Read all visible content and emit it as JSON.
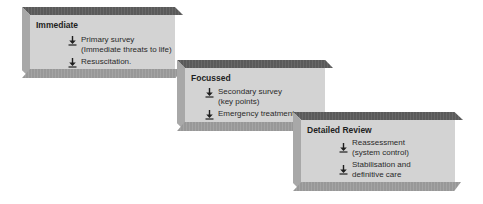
{
  "diagram": {
    "type": "staged 3D block flow",
    "colors": {
      "face": "#d3d3d3",
      "top_bevel": "#5f5f5f",
      "left_bevel": "#a8a8a8",
      "bottom_bevel": "#9e9e9e",
      "text": "#2a2a2a"
    },
    "stages": [
      {
        "title": "Immediate",
        "items": [
          {
            "icon": "down-arrow-icon",
            "text": "Primary survey\n(Immediate threats to life)"
          },
          {
            "icon": "down-arrow-icon",
            "text": "Resuscitation."
          }
        ]
      },
      {
        "title": "Focussed",
        "items": [
          {
            "icon": "down-arrow-icon",
            "text": "Secondary survey\n(key points)"
          },
          {
            "icon": "down-arrow-icon",
            "text": "Emergency treatment"
          }
        ]
      },
      {
        "title": "Detailed Review",
        "items": [
          {
            "icon": "down-arrow-icon",
            "text": "Reassessment\n(system control)"
          },
          {
            "icon": "down-arrow-icon",
            "text": "Stabilisation and\ndefinitive care"
          }
        ]
      }
    ]
  }
}
